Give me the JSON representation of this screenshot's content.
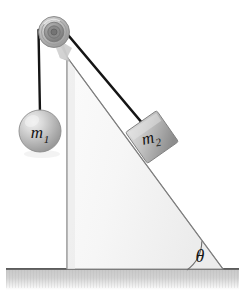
{
  "figure": {
    "type": "physics-diagram",
    "width": 245,
    "height": 298,
    "background_color": "#ffffff"
  },
  "labels": {
    "mass_one": "m",
    "mass_one_subscript": "1",
    "mass_two": "m",
    "mass_two_subscript": "2",
    "angle": "θ"
  },
  "colors": {
    "background": "#ffffff",
    "incline_fill_light": "#fdfdfd",
    "incline_fill_dark": "#e6e6e6",
    "incline_stroke": "#8a8a8a",
    "ground_top": "#5a5a5a",
    "ground_fill_light": "#d8d8d8",
    "ground_fill_dark": "#b4b4b4",
    "rope": "#1a1a1a",
    "pulley_outer": "#9a9a9a",
    "pulley_mid": "#b8b8b8",
    "pulley_inner": "#7d7d7d",
    "pulley_hub": "#6e6e6e",
    "sphere_light": "#e2e2e2",
    "sphere_dark": "#9c9c9c",
    "block_light": "#d6d6d6",
    "block_dark": "#8f8f8f",
    "label_text": "#141414",
    "angle_arc": "#6a6a6a"
  },
  "geometry": {
    "incline": {
      "apex": {
        "x": 67,
        "y": 57
      },
      "bottom_left": {
        "x": 67,
        "y": 270
      },
      "bottom_right": {
        "x": 223,
        "y": 270
      },
      "angle_degrees": 54
    },
    "ground": {
      "x": 6,
      "y": 268,
      "width": 233,
      "height": 22
    },
    "pulley": {
      "center": {
        "x": 54,
        "y": 32
      },
      "outer_radius": 15,
      "ring_radii": [
        15,
        12.5,
        9.5,
        6,
        3
      ]
    },
    "mass_one": {
      "center": {
        "x": 40,
        "y": 131
      },
      "radius": 21,
      "rope_from": {
        "x": 38,
        "y": 36
      },
      "rope_to": {
        "x": 40,
        "y": 112
      }
    },
    "mass_two": {
      "center": {
        "x": 152,
        "y": 137
      },
      "size": 36,
      "rotation_degrees": -35,
      "rope_from": {
        "x": 63,
        "y": 31
      },
      "rope_to": {
        "x": 142,
        "y": 123
      }
    },
    "angle_arc": {
      "center": {
        "x": 223,
        "y": 270
      },
      "radius": 36,
      "start_degrees": 180,
      "end_degrees": 126
    }
  }
}
